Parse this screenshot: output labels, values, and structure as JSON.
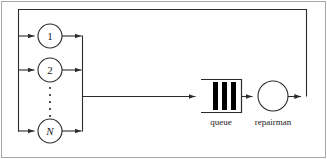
{
  "figure": {
    "kind": "machine-repairman-queueing-diagram",
    "border_color": "#a8a8a8",
    "line_color": "#2b2b2b",
    "fill_color": "#ffffff",
    "bar_color": "#000000",
    "background": "#ffffff"
  },
  "machines": {
    "nodes": [
      {
        "id": "machine-1",
        "label": "1",
        "italic": false,
        "cx": 50,
        "cy": 36,
        "r": 12
      },
      {
        "id": "machine-2",
        "label": "2",
        "italic": false,
        "cx": 50,
        "cy": 70,
        "r": 12
      },
      {
        "id": "machine-n",
        "label": "N",
        "italic": true,
        "cx": 50,
        "cy": 131,
        "r": 12
      }
    ],
    "ellipsis": {
      "name": "vertical-ellipsis",
      "dot_count": 5,
      "cx": 50,
      "y_start": 88,
      "y_step": 7,
      "radius": 1.1
    }
  },
  "queue": {
    "label": "queue",
    "x": 201,
    "y": 79,
    "width": 41,
    "height": 34,
    "bars": 3,
    "bar_width": 5,
    "open_side": "left"
  },
  "server": {
    "label": "repairman",
    "cx": 273,
    "cy": 96,
    "r": 15
  },
  "connections": [
    {
      "name": "feedback-top-line",
      "from": "server-output",
      "to": "machine-bus-left"
    },
    {
      "name": "machine-1-input-arrow",
      "to": "machine-1"
    },
    {
      "name": "machine-2-input-arrow",
      "to": "machine-2"
    },
    {
      "name": "machine-n-input-arrow",
      "to": "machine-n"
    },
    {
      "name": "machine-1-output-arrow",
      "to": "collector-bus"
    },
    {
      "name": "machine-2-output-arrow",
      "to": "collector-bus"
    },
    {
      "name": "machine-n-output-arrow",
      "to": "collector-bus"
    },
    {
      "name": "bus-to-queue-arrow",
      "from": "collector-bus",
      "to": "queue"
    },
    {
      "name": "queue-to-server-arrow",
      "from": "queue",
      "to": "server"
    },
    {
      "name": "server-to-feedback-arrow",
      "from": "server",
      "to": "feedback-right-line"
    }
  ]
}
